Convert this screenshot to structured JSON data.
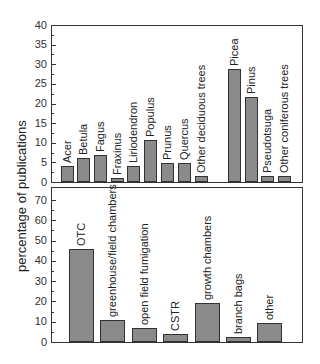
{
  "chart_data": [
    {
      "type": "bar",
      "title": "",
      "ylabel": "percentage of publications",
      "ylim": [
        0,
        40
      ],
      "yticks": [
        0,
        5,
        10,
        15,
        20,
        25,
        30,
        35,
        40
      ],
      "categories": [
        "Acer",
        "Betula",
        "Fagus",
        "Fraxinus",
        "Liriodendron",
        "Populus",
        "Prunus",
        "Quercus",
        "Other deciduous trees",
        "Picea",
        "Pinus",
        "Pseudotsuga",
        "Other coniferous trees"
      ],
      "values": [
        4,
        6,
        7,
        1,
        4,
        10.7,
        4.8,
        4.8,
        1.5,
        28.8,
        21.6,
        1.5,
        1.5
      ],
      "groups": [
        {
          "name": "deciduous",
          "categories": [
            "Acer",
            "Betula",
            "Fagus",
            "Fraxinus",
            "Liriodendron",
            "Populus",
            "Prunus",
            "Quercus",
            "Other deciduous trees"
          ]
        },
        {
          "name": "coniferous",
          "categories": [
            "Picea",
            "Pinus",
            "Pseudotsuga",
            "Other coniferous trees"
          ]
        }
      ]
    },
    {
      "type": "bar",
      "title": "",
      "ylabel": "percentage of publications",
      "ylim": [
        0,
        70
      ],
      "yticks": [
        0,
        10,
        20,
        30,
        40,
        50,
        60,
        70
      ],
      "categories": [
        "OTC",
        "greenhouse/field chambers",
        "open field fumigation",
        "CSTR",
        "growth chambers",
        "branch bags",
        "other"
      ],
      "values": [
        46,
        11,
        7,
        4,
        19,
        2.5,
        9.5
      ]
    }
  ],
  "axis_title": "percentage of publications"
}
